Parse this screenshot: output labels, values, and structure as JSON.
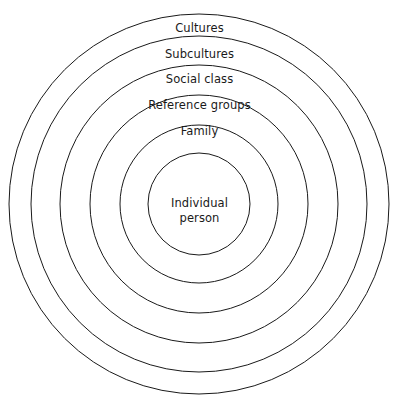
{
  "diagram": {
    "type": "concentric-circles",
    "title_visible": false,
    "background_color": "#ffffff",
    "stroke_color": "#1a1a1a",
    "text_color": "#1a1a1a",
    "stroke_width": 1,
    "center": {
      "x": 199,
      "y": 204
    },
    "rings": [
      {
        "label": "Cultures",
        "radius": 190,
        "label_y": 22,
        "level": 1
      },
      {
        "label": "Subcultures",
        "radius": 168,
        "label_y": 48,
        "level": 2
      },
      {
        "label": "Social class",
        "radius": 139,
        "label_y": 73,
        "level": 3
      },
      {
        "label": "Reference groups",
        "radius": 109,
        "label_y": 99,
        "level": 4
      },
      {
        "label": "Family",
        "radius": 79,
        "label_y": 125,
        "level": 5
      }
    ],
    "core": {
      "radius": 51,
      "line1": "Individual",
      "line2": "person"
    }
  }
}
